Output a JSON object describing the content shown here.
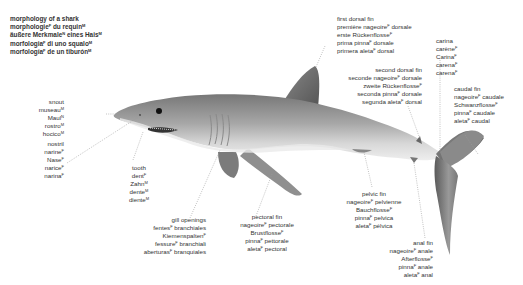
{
  "title": {
    "lines": [
      {
        "text": "morphology of a shark",
        "g": ""
      },
      {
        "text": "morphologie",
        "g": "F",
        "rest": " du requin",
        "g2": "M"
      },
      {
        "text": "äußere Merkmale",
        "g": "N",
        "rest": " eines Hais",
        "g2": "M"
      },
      {
        "text": "morfologia",
        "g": "F",
        "rest": " di uno squalo",
        "g2": "M"
      },
      {
        "text": "morfología",
        "g": "F",
        "rest": " de un tiburón",
        "g2": "M"
      }
    ]
  },
  "labels": {
    "first_dorsal_fin": [
      {
        "w": "first dorsal fin",
        "g": "",
        "r": ""
      },
      {
        "w": "première nageoire",
        "g": "F",
        "r": " dorsale"
      },
      {
        "w": "erste Rückenflosse",
        "g": "F",
        "r": ""
      },
      {
        "w": "prima pinna",
        "g": "F",
        "r": " dorsale"
      },
      {
        "w": "primera aleta",
        "g": "F",
        "r": " dorsal"
      }
    ],
    "second_dorsal_fin": [
      {
        "w": "second dorsal fin",
        "g": "",
        "r": ""
      },
      {
        "w": "seconde nageoire",
        "g": "F",
        "r": " dorsale"
      },
      {
        "w": "zweite Rückenflosse",
        "g": "F",
        "r": ""
      },
      {
        "w": "seconda pinna",
        "g": "F",
        "r": " dorsale"
      },
      {
        "w": "segunda aleta",
        "g": "F",
        "r": " dorsal"
      }
    ],
    "carina": [
      {
        "w": "carina",
        "g": "",
        "r": ""
      },
      {
        "w": "carène",
        "g": "F",
        "r": ""
      },
      {
        "w": "Carina",
        "g": "F",
        "r": ""
      },
      {
        "w": "carena",
        "g": "F",
        "r": ""
      },
      {
        "w": "carena",
        "g": "F",
        "r": ""
      }
    ],
    "caudal_fin": [
      {
        "w": "caudal fin",
        "g": "",
        "r": ""
      },
      {
        "w": "nageoire",
        "g": "F",
        "r": " caudale"
      },
      {
        "w": "Schwanzflosse",
        "g": "F",
        "r": ""
      },
      {
        "w": "pinna",
        "g": "F",
        "r": " caudale"
      },
      {
        "w": "aleta",
        "g": "F",
        "r": " caudal"
      }
    ],
    "snout": [
      {
        "w": "snout",
        "g": "",
        "r": ""
      },
      {
        "w": "museau",
        "g": "M",
        "r": ""
      },
      {
        "w": "Maul",
        "g": "N",
        "r": ""
      },
      {
        "w": "rostro",
        "g": "M",
        "r": ""
      },
      {
        "w": "hocico",
        "g": "M",
        "r": ""
      }
    ],
    "nostril": [
      {
        "w": "nostril",
        "g": "",
        "r": ""
      },
      {
        "w": "narine",
        "g": "F",
        "r": ""
      },
      {
        "w": "Nase",
        "g": "F",
        "r": ""
      },
      {
        "w": "narice",
        "g": "F",
        "r": ""
      },
      {
        "w": "narina",
        "g": "F",
        "r": ""
      }
    ],
    "tooth": [
      {
        "w": "tooth",
        "g": "",
        "r": ""
      },
      {
        "w": "dent",
        "g": "F",
        "r": ""
      },
      {
        "w": "Zahn",
        "g": "M",
        "r": ""
      },
      {
        "w": "dente",
        "g": "M",
        "r": ""
      },
      {
        "w": "diente",
        "g": "M",
        "r": ""
      }
    ],
    "gill_openings": [
      {
        "w": "gill openings",
        "g": "",
        "r": ""
      },
      {
        "w": "fentes",
        "g": "F",
        "r": " branchiales"
      },
      {
        "w": "Kiemenspalten",
        "g": "F",
        "r": ""
      },
      {
        "w": "fessure",
        "g": "F",
        "r": " branchiali"
      },
      {
        "w": "aberturas",
        "g": "F",
        "r": " branquiales"
      }
    ],
    "pectoral_fin": [
      {
        "w": "pectoral fin",
        "g": "",
        "r": ""
      },
      {
        "w": "nageoire",
        "g": "F",
        "r": " pectorale"
      },
      {
        "w": "Brustflosse",
        "g": "F",
        "r": ""
      },
      {
        "w": "pinna",
        "g": "F",
        "r": " pettorale"
      },
      {
        "w": "aleta",
        "g": "F",
        "r": " pectoral"
      }
    ],
    "pelvic_fin": [
      {
        "w": "pelvic fin",
        "g": "",
        "r": ""
      },
      {
        "w": "nageoire",
        "g": "F",
        "r": " pelvienne"
      },
      {
        "w": "Bauchflosse",
        "g": "F",
        "r": ""
      },
      {
        "w": "pinna",
        "g": "F",
        "r": " pelvica"
      },
      {
        "w": "aleta",
        "g": "F",
        "r": " pélvica"
      }
    ],
    "anal_fin": [
      {
        "w": "anal fin",
        "g": "",
        "r": ""
      },
      {
        "w": "nageoire",
        "g": "F",
        "r": " anale"
      },
      {
        "w": "Afterflosse",
        "g": "F",
        "r": ""
      },
      {
        "w": "pinna",
        "g": "F",
        "r": " anale"
      },
      {
        "w": "aleta",
        "g": "F",
        "r": " anal"
      }
    ]
  },
  "colors": {
    "body_dark": "#6a6a6a",
    "body_mid": "#9a9a9a",
    "belly": "#e6e6e6",
    "leader": "#9a9a9a",
    "text": "#333333"
  }
}
